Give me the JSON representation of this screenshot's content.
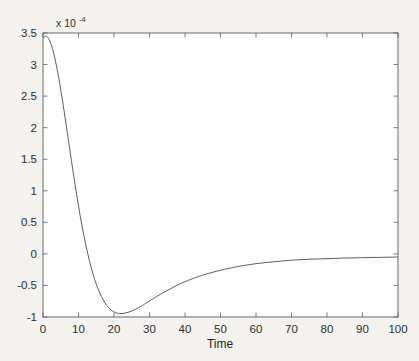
{
  "chart_data": {
    "type": "line",
    "title": "",
    "subtitle": "",
    "xlabel": "Time",
    "ylabel": "",
    "y_exponent_label": "x 10",
    "y_exponent_power": "-4",
    "y_scale_factor": 0.0001,
    "xlim": [
      0,
      100
    ],
    "ylim": [
      -1,
      3.5
    ],
    "xticks": [
      0,
      10,
      20,
      30,
      40,
      50,
      60,
      70,
      80,
      90,
      100
    ],
    "xticklabels": [
      "0",
      "10",
      "20",
      "30",
      "40",
      "50",
      "60",
      "70",
      "80",
      "90",
      "100"
    ],
    "yticks": [
      -1,
      -0.5,
      0,
      0.5,
      1,
      1.5,
      2,
      2.5,
      3,
      3.5
    ],
    "yticklabels": [
      "-1",
      "-0.5",
      "0",
      "0.5",
      "1",
      "1.5",
      "2",
      "2.5",
      "3",
      "3.5"
    ],
    "grid": false,
    "legend": null,
    "legend_position": "none",
    "box": true,
    "tick_direction": "in",
    "line_color": "#4a4a4a",
    "line_width": 0.9,
    "background_color": "#ffffff",
    "page_color": "#f4f3f0",
    "axis_color": "#5a5a5a",
    "annotations": [],
    "series": [
      {
        "name": "impulse response",
        "x": [
          0,
          1,
          2,
          3,
          4,
          5,
          6,
          7,
          8,
          9,
          10,
          11,
          12,
          13,
          14,
          15,
          16,
          17,
          18,
          19,
          20,
          21,
          22,
          23,
          24,
          25,
          26,
          27,
          28,
          29,
          30,
          32,
          34,
          36,
          38,
          40,
          43,
          46,
          50,
          55,
          60,
          65,
          70,
          75,
          80,
          85,
          90,
          95,
          100
        ],
        "y": [
          3.42,
          3.45,
          3.36,
          3.18,
          2.92,
          2.6,
          2.24,
          1.86,
          1.48,
          1.11,
          0.76,
          0.44,
          0.16,
          -0.09,
          -0.3,
          -0.48,
          -0.62,
          -0.73,
          -0.82,
          -0.88,
          -0.92,
          -0.94,
          -0.945,
          -0.94,
          -0.925,
          -0.905,
          -0.88,
          -0.85,
          -0.82,
          -0.78,
          -0.745,
          -0.675,
          -0.61,
          -0.55,
          -0.49,
          -0.44,
          -0.375,
          -0.32,
          -0.26,
          -0.2,
          -0.155,
          -0.125,
          -0.1,
          -0.085,
          -0.075,
          -0.066,
          -0.06,
          -0.055,
          -0.05
        ]
      }
    ]
  }
}
